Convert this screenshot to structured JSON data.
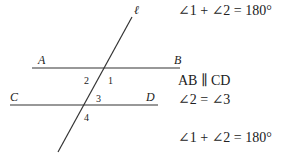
{
  "diagram": {
    "transversal_label": "ℓ",
    "points": {
      "A": "A",
      "B": "B",
      "C": "C",
      "D": "D"
    },
    "angles": {
      "a1": "1",
      "a2": "2",
      "a3": "3",
      "a4": "4"
    },
    "lines": [
      "AB",
      "CD",
      "ℓ"
    ]
  },
  "equations": [
    "∠1 + ∠2 = 180°",
    "AB ∥ CD",
    "∠2 = ∠3",
    "∠1 + ∠2 = 180°"
  ],
  "colors": {
    "stroke": "#333333",
    "text": "#222222"
  }
}
